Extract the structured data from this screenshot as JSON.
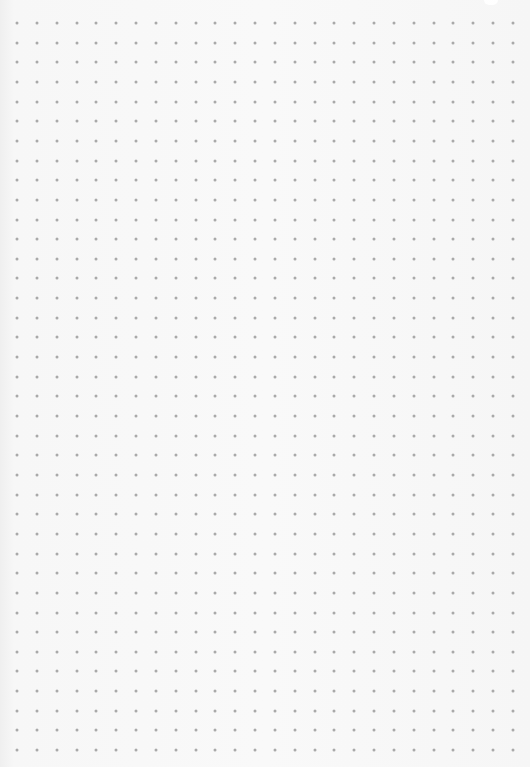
{
  "page": {
    "type": "dot-grid-paper",
    "background_color": "#f8f8f8",
    "dot_color": "#a9a9a9"
  },
  "grid": {
    "origin_x": 17,
    "origin_y": 23,
    "spacing_x": 19.84,
    "spacing_y": 19.65,
    "columns": 26,
    "rows": 38,
    "dot_size": 3
  }
}
